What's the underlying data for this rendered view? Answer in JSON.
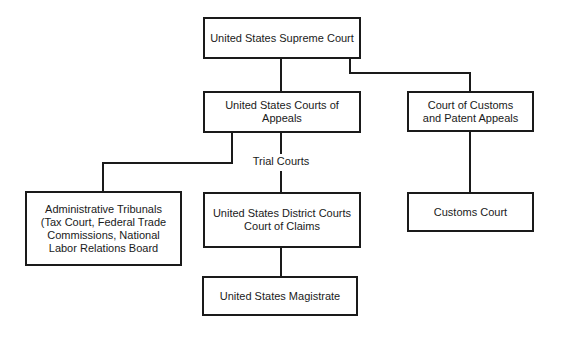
{
  "diagram": {
    "type": "org-chart",
    "nodes": {
      "supreme": "United States Supreme Court",
      "appeals": "United States Courts of Appeals",
      "customs_appeals": "Court of Customs\nand Patent Appeals",
      "admin": "Administrative Tribunals\n(Tax Court, Federal Trade\nCommissions, National\nLabor Relations Board",
      "district": "United States District Courts\nCourt of Claims",
      "customs_court": "Customs Court",
      "magistrate": "United States Magistrate"
    },
    "labels": {
      "trial_courts": "Trial Courts"
    },
    "edges": [
      [
        "supreme",
        "appeals"
      ],
      [
        "supreme",
        "customs_appeals"
      ],
      [
        "appeals",
        "admin"
      ],
      [
        "appeals",
        "district"
      ],
      [
        "customs_appeals",
        "customs_court"
      ],
      [
        "district",
        "magistrate"
      ]
    ]
  }
}
